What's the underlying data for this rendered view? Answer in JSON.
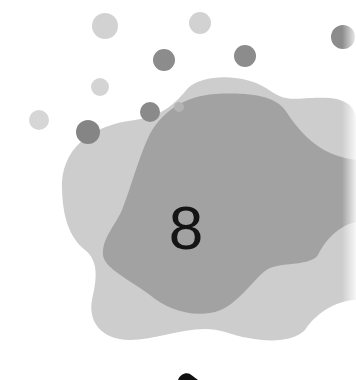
{
  "illustration": {
    "number_label": "8",
    "colors": {
      "background": "#ffffff",
      "light_blob": "#cdcdcd",
      "dark_blob": "#9e9e9e",
      "light_dot": "#d2d2d2",
      "dark_dot": "#8c8c8c",
      "digit": "#141414",
      "bottom_mark": "#111111"
    },
    "light_dots": [
      {
        "cx": 105,
        "cy": 26,
        "r": 13
      },
      {
        "cx": 200,
        "cy": 23,
        "r": 11
      },
      {
        "cx": 100,
        "cy": 87,
        "r": 9
      },
      {
        "cx": 39,
        "cy": 120,
        "r": 10
      }
    ],
    "dark_dots": [
      {
        "cx": 164,
        "cy": 60,
        "r": 11
      },
      {
        "cx": 245,
        "cy": 56,
        "r": 11
      },
      {
        "cx": 150,
        "cy": 112,
        "r": 10
      },
      {
        "cx": 88,
        "cy": 132,
        "r": 12
      },
      {
        "cx": 343,
        "cy": 37,
        "r": 12
      },
      {
        "cx": 179,
        "cy": 107,
        "r": 5
      }
    ]
  }
}
